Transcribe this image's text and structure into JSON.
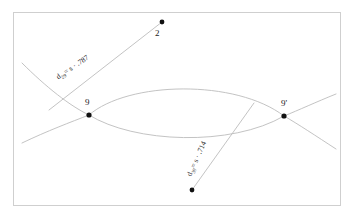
{
  "figure": {
    "background_color": "#ffffff",
    "border_color": "#cfcfcf",
    "curve_color": "#b9b9b9",
    "point_color": "#111111",
    "text_color": "#1a1a1a"
  },
  "points": [
    {
      "id": "point-2",
      "label": "2",
      "x": 162,
      "y": 22,
      "label_x": 155,
      "label_y": 29
    },
    {
      "id": "point-9",
      "label": "9",
      "x": 89,
      "y": 115,
      "label_x": 85,
      "label_y": 98
    },
    {
      "id": "point-9-prime",
      "label": "9'",
      "x": 284,
      "y": 116,
      "label_x": 281,
      "label_y": 99
    },
    {
      "id": "point-bottom",
      "label": "",
      "x": 192,
      "y": 190,
      "label_x": 0,
      "label_y": 0
    }
  ],
  "distance_labels": [
    {
      "id": "distance-label-29",
      "symbol": "d",
      "subscript": "29",
      "equals": "= s · ",
      "value": ".787",
      "full_text": "d29 = s · .787",
      "x": 57,
      "y": 74,
      "rotation": -34
    },
    {
      "id": "distance-label-39",
      "symbol": "d",
      "subscript": "39",
      "equals": "= s · ",
      "value": ".714",
      "full_text": "d39 = s · .714",
      "x": 189,
      "y": 172,
      "rotation": -66
    }
  ],
  "strokes": {
    "line_2_to_9": "M 162 22 L 50 109",
    "line_bottom_to_9prime": "M 192 190 L 253 104",
    "lens_upper": "M 89 115 C 130 82, 235 80, 284 116",
    "lens_lower": "M 89 115 C 135 142, 230 146, 284 116",
    "hyperbola_left_upper": "M 22 64 C 48 88, 70 105, 89 115",
    "hyperbola_left_lower": "M 22 142 C 48 130, 70 122, 89 115",
    "hyperbola_right_upper": "M 336 95 C 315 103, 298 110, 284 116",
    "hyperbola_right_lower": "M 336 148 C 315 135, 297 124, 284 116"
  },
  "border": {
    "x": 13,
    "y": 12,
    "width": 328,
    "height": 194
  }
}
